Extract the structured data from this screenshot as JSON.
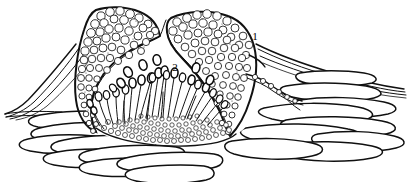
{
  "figure": {
    "background_color": "#ffffff",
    "ink_color": "#111111",
    "width": 409,
    "height": 182,
    "labels": [
      {
        "id": "label-1",
        "text": "1",
        "x": 257,
        "y": 37,
        "refers_to": "pycnidial-wall"
      },
      {
        "id": "label-2",
        "text": "2",
        "x": 175,
        "y": 68,
        "refers_to": "conidia"
      }
    ],
    "parts": {
      "pycnidial_wall_left": "left pseudoparenchymatous wall mass",
      "pycnidial_wall_right": "right pseudoparenchymatous wall mass",
      "ostiole": "apical opening between wall masses",
      "cavity": "internal locule",
      "conidiophores": "radiating conidiophores lining the cavity base",
      "conidia": "ellipsoid conidia released into the cavity",
      "basal_stroma": "basal cell layer of small rounded cells",
      "host_tissue": "elongate host epidermal and sub-epidermal cells",
      "cuticle_lines": "sweeping cuticle / epidermal outline strokes",
      "emergent_hypha": "hypha emerging through the right wall"
    }
  }
}
